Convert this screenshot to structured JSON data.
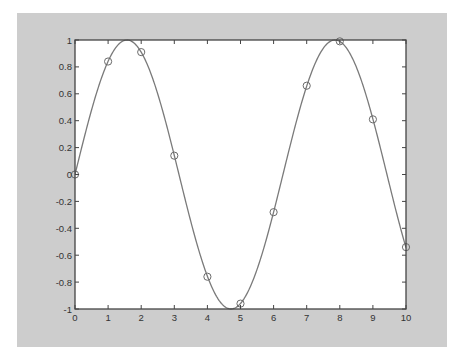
{
  "colors": {
    "figure_background": "#cdcdcd",
    "axes_background": "#ffffff",
    "axes_border": "#444444",
    "curve": "#7a7a7a",
    "markers": "#6a6a6a",
    "tick_labels": "#333333"
  },
  "chart_data": {
    "type": "line",
    "title": "",
    "xlabel": "",
    "ylabel": "",
    "xlim": [
      0,
      10
    ],
    "ylim": [
      -1,
      1
    ],
    "grid": false,
    "legend": null,
    "xticks": [
      0,
      1,
      2,
      3,
      4,
      5,
      6,
      7,
      8,
      9,
      10
    ],
    "xtick_labels": [
      "0",
      "1",
      "2",
      "3",
      "4",
      "5",
      "6",
      "7",
      "8",
      "9",
      "10"
    ],
    "yticks": [
      -1,
      -0.8,
      -0.6,
      -0.4,
      -0.2,
      0,
      0.2,
      0.4,
      0.6,
      0.8,
      1
    ],
    "ytick_labels": [
      "-1",
      "-0.8",
      "-0.6",
      "-0.4",
      "-0.2",
      "0",
      "0.2",
      "0.4",
      "0.6",
      "0.8",
      "1"
    ],
    "series": [
      {
        "name": "sin(x) curve",
        "style": "solid line",
        "function": "sin(x)",
        "x_range": [
          0,
          10
        ]
      },
      {
        "name": "sample points",
        "style": "circle markers",
        "x": [
          0,
          1,
          2,
          3,
          4,
          5,
          6,
          7,
          8,
          9,
          10
        ],
        "y": [
          0,
          0.84,
          0.91,
          0.14,
          -0.76,
          -0.96,
          -0.28,
          0.66,
          0.99,
          0.41,
          -0.54
        ]
      }
    ]
  }
}
